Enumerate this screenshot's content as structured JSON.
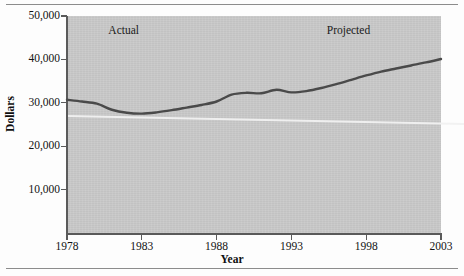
{
  "figure": {
    "background_color": "#fdfdfd",
    "plot_background_color": "#c9c9c9",
    "line_color": "#4a4a4a",
    "axis_color": "#5a5a5a"
  },
  "chart_data": {
    "type": "line",
    "title": "",
    "xlabel": "Year",
    "ylabel": "Dollars",
    "xlim": [
      1978,
      2003
    ],
    "ylim": [
      0,
      50000
    ],
    "grid": false,
    "legend": "none",
    "xticks": [
      1978,
      1983,
      1988,
      1993,
      1998,
      2003
    ],
    "xtick_labels": [
      "1978",
      "1983",
      "1988",
      "1993",
      "1998",
      "2003"
    ],
    "yticks": [
      10000,
      20000,
      30000,
      40000,
      50000
    ],
    "ytick_labels": [
      "10,000",
      "20,000",
      "30,000",
      "40,000",
      "50,000"
    ],
    "annotations": [
      {
        "text": "Actual",
        "x": 1981.8,
        "y": 46500
      },
      {
        "text": "Projected",
        "x": 1996.8,
        "y": 46500
      }
    ],
    "series": [
      {
        "name": "Dollars",
        "x": [
          1978,
          1979,
          1980,
          1981,
          1982,
          1983,
          1984,
          1985,
          1986,
          1987,
          1988,
          1989,
          1990,
          1991,
          1992,
          1993,
          1994,
          1995,
          1996,
          1997,
          1998,
          1999,
          2000,
          2001,
          2002,
          2003
        ],
        "values": [
          30700,
          30300,
          29800,
          28400,
          27700,
          27500,
          27800,
          28300,
          28900,
          29500,
          30300,
          31900,
          32300,
          32200,
          33000,
          32400,
          32700,
          33400,
          34300,
          35300,
          36300,
          37200,
          37900,
          38600,
          39300,
          40100
        ]
      }
    ]
  }
}
